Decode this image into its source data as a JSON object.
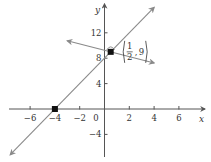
{
  "chart_data": {
    "type": "line",
    "title": "",
    "xlabel": "x",
    "ylabel": "y",
    "xlim": [
      -7.5,
      7.5
    ],
    "ylim": [
      -7.5,
      16
    ],
    "x_ticks": [
      -6,
      -4,
      -2,
      2,
      4,
      6
    ],
    "x_tick_labels": [
      "−6",
      "−4",
      "−2",
      "2",
      "4",
      "6"
    ],
    "y_ticks": [
      12,
      8,
      4,
      -4
    ],
    "y_tick_labels": [
      "12",
      "8",
      "4",
      "−4"
    ],
    "origin_label": "0",
    "grid": false,
    "series": [
      {
        "name": "line-1",
        "equation": "y = 2x + 8",
        "slope": 2,
        "intercept": 8,
        "x_range": [
          -7.6,
          4
        ],
        "arrows": "both",
        "color": "#8a8a8a"
      },
      {
        "name": "line-2",
        "equation": "y = -x/2 + 37/4",
        "slope": -0.5,
        "intercept": 9.25,
        "x_range": [
          -3,
          4
        ],
        "arrows": "both",
        "color": "#8a8a8a"
      }
    ],
    "points": [
      {
        "name": "x-intercept",
        "x": -4,
        "y": 0,
        "label": ""
      },
      {
        "name": "intersection",
        "x": 0.5,
        "y": 9,
        "label": "(1/2, 9)",
        "label_num": "1",
        "label_den": "2",
        "label_y": "9"
      }
    ],
    "annotations": [
      {
        "type": "right-angle",
        "at": [
          0.5,
          9
        ]
      }
    ]
  }
}
